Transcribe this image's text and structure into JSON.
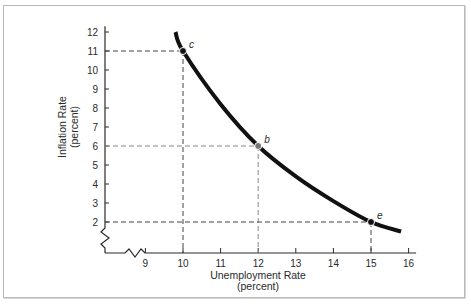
{
  "chart_data": {
    "type": "line",
    "title": "",
    "xlabel": "Unemployment Rate",
    "xlabel_sub": "(percent)",
    "ylabel": "Inflation Rate",
    "ylabel_sub": "(percent)",
    "xlim": [
      8.0,
      16.2
    ],
    "ylim": [
      0.5,
      12.3
    ],
    "x_axis_break": true,
    "y_axis_break": true,
    "grid": false,
    "xticks": [
      9,
      10,
      11,
      12,
      13,
      14,
      15,
      16
    ],
    "xtick_labels": [
      "9",
      "10",
      "11",
      "12",
      "13",
      "14",
      "15",
      "16"
    ],
    "yticks": [
      2,
      3,
      4,
      5,
      6,
      7,
      8,
      9,
      10,
      11,
      12
    ],
    "ytick_labels": [
      "2",
      "3",
      "4",
      "5",
      "6",
      "7",
      "8",
      "9",
      "10",
      "11",
      "12"
    ],
    "series": [
      {
        "name": "Phillips curve",
        "x": [
          9.8,
          10,
          11,
          12,
          13,
          14,
          15,
          15.8
        ],
        "y": [
          12.0,
          11,
          8.2,
          6,
          4.4,
          3.1,
          2,
          1.5
        ]
      }
    ],
    "points": [
      {
        "label": "c",
        "x": 10,
        "y": 11
      },
      {
        "label": "b",
        "x": 12,
        "y": 6
      },
      {
        "label": "e",
        "x": 15,
        "y": 2
      }
    ]
  }
}
